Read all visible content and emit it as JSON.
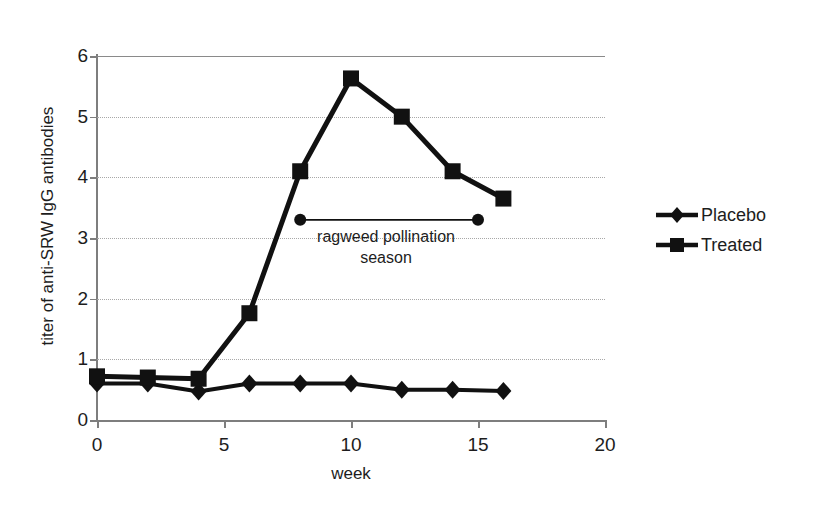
{
  "chart_data": {
    "type": "line",
    "title": "",
    "xlabel": "week",
    "ylabel": "titer of anti-SRW IgG antibodies",
    "xlim": [
      0,
      20
    ],
    "ylim": [
      0,
      6
    ],
    "xticks": [
      0,
      5,
      10,
      15,
      20
    ],
    "yticks": [
      0,
      1,
      2,
      3,
      4,
      5,
      6
    ],
    "xtick_labels": [
      "0",
      "5",
      "10",
      "15",
      "20"
    ],
    "ytick_labels": [
      "0",
      "1",
      "2",
      "3",
      "4",
      "5",
      "6"
    ],
    "grid": "horizontal-dotted",
    "legend_position": "right",
    "series": [
      {
        "name": "Placebo",
        "marker": "diamond",
        "color": "#111111",
        "x": [
          0,
          2,
          4,
          6,
          8,
          10,
          12,
          14,
          16
        ],
        "values": [
          0.6,
          0.6,
          0.47,
          0.6,
          0.6,
          0.6,
          0.5,
          0.5,
          0.48
        ]
      },
      {
        "name": "Treated",
        "marker": "square",
        "color": "#111111",
        "x": [
          0,
          2,
          4,
          6,
          8,
          10,
          12,
          14,
          16
        ],
        "values": [
          0.72,
          0.7,
          0.68,
          1.76,
          4.1,
          5.63,
          5.0,
          4.1,
          3.65
        ]
      }
    ],
    "annotations": [
      {
        "name": "ragweed-pollination-season",
        "text_line1": "ragweed pollination",
        "text_line2": "season",
        "bar_x_start": 8,
        "bar_x_end": 15,
        "bar_y": 3.3,
        "marker": "circle"
      }
    ]
  },
  "axes": {
    "y_title": "titer of anti-SRW IgG antibodies",
    "x_title": "week",
    "y_labels": [
      "6",
      "5",
      "4",
      "3",
      "2",
      "1",
      "0"
    ],
    "x_labels": [
      "0",
      "5",
      "10",
      "15",
      "20"
    ]
  },
  "legend": {
    "items": [
      {
        "label": "Placebo",
        "marker": "diamond"
      },
      {
        "label": "Treated",
        "marker": "square"
      }
    ]
  },
  "annotation": {
    "line1": "ragweed pollination",
    "line2": "season"
  },
  "colors": {
    "series": "#111111",
    "axis": "#7e7e7e",
    "grid": "#a8a8a8",
    "text": "#1d1d1d",
    "background": "#ffffff"
  }
}
